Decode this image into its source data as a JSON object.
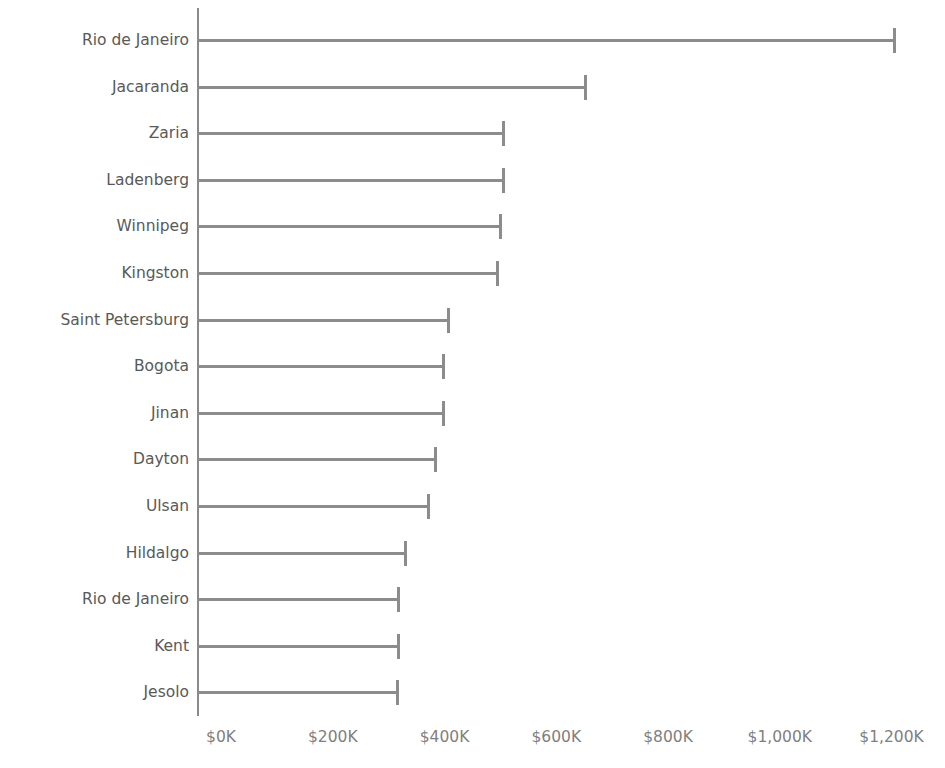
{
  "chart_data": {
    "type": "bar",
    "orientation": "horizontal",
    "title": "",
    "xlabel": "",
    "ylabel": "",
    "categories": [
      "Rio de Janeiro",
      "Jacaranda",
      "Zaria",
      "Ladenberg",
      "Winnipeg",
      "Kingston",
      "Saint Petersburg",
      "Bogota",
      "Jinan",
      "Dayton",
      "Ulsan",
      "Hildalgo",
      "Rio de Janeiro",
      "Kent",
      "Jesolo"
    ],
    "values": [
      1208000,
      655000,
      508000,
      508000,
      503000,
      497000,
      410000,
      401000,
      401000,
      387000,
      374000,
      333000,
      320000,
      320000,
      319000
    ],
    "value_labels": [
      "$1,208K",
      "$655K",
      "$508K",
      "$508K",
      "$503K",
      "$497K",
      "$410K",
      "$401K",
      "$401K",
      "$387K",
      "$374K",
      "$333K",
      "$320K",
      "$320K",
      "$319K"
    ],
    "xlim": [
      0,
      1200000
    ],
    "x_ticks": [
      0,
      200000,
      400000,
      600000,
      800000,
      1000000,
      1200000
    ],
    "x_tick_labels": [
      "$0K",
      "$200K",
      "$400K",
      "$600K",
      "$800K",
      "$1,000K",
      "$1,200K"
    ],
    "grid": false,
    "legend": null,
    "series_color": "#8c8c8c",
    "axis_color": "#8a8a8a",
    "label_color": "#595959",
    "tick_label_color": "#808080",
    "background": "#ffffff"
  },
  "geometry": {
    "axis_x_px": 197,
    "x0_px": 221,
    "px_per_200k": 111.75,
    "first_row_y_px": 40,
    "row_step_px": 46.6,
    "x_axis_label_y_px": 726
  }
}
